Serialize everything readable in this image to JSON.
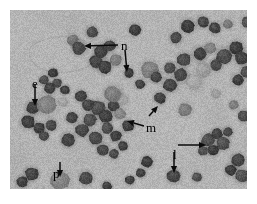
{
  "figure": {
    "kind": "light-micrograph",
    "border_color": "#ffffff",
    "background_color": "#b3b3b3",
    "cell_dark_color": "#3a3a3a",
    "cell_mid_color": "#6e6e6e",
    "cell_pale_color": "#989898"
  },
  "annotations": [
    {
      "id": "n",
      "label": "n",
      "meaning": "neutrophil",
      "label_x": 111,
      "label_y": 29,
      "arrows": [
        {
          "x1": 108,
          "y1": 35,
          "x2": 74,
          "y2": 36,
          "head": "left"
        },
        {
          "x1": 115,
          "y1": 40,
          "x2": 117,
          "y2": 62,
          "head": "down"
        }
      ]
    },
    {
      "id": "e",
      "label": "e",
      "meaning": "eosinophil",
      "label_x": 22,
      "label_y": 67,
      "arrows": [
        {
          "x1": 25,
          "y1": 74,
          "x2": 25,
          "y2": 96,
          "head": "down"
        }
      ]
    },
    {
      "id": "m",
      "label": "m",
      "meaning": "macrophage",
      "label_x": 136,
      "label_y": 111,
      "arrows": [
        {
          "x1": 134,
          "y1": 116,
          "x2": 117,
          "y2": 111,
          "head": "left-down"
        },
        {
          "x1": 139,
          "y1": 106,
          "x2": 148,
          "y2": 96,
          "head": "up-right"
        }
      ]
    },
    {
      "id": "l",
      "label": "l",
      "meaning": "lymphocyte",
      "label_x": 163,
      "label_y": 138,
      "arrows": [
        {
          "x1": 168,
          "y1": 135,
          "x2": 196,
          "y2": 135,
          "head": "right"
        },
        {
          "x1": 164,
          "y1": 142,
          "x2": 164,
          "y2": 163,
          "head": "down"
        }
      ]
    },
    {
      "id": "p",
      "label": "p",
      "meaning": "plasma cell",
      "label_x": 43,
      "label_y": 157,
      "arrows": [
        {
          "x1": 50,
          "y1": 152,
          "x2": 50,
          "y2": 167,
          "head": "down"
        }
      ]
    }
  ],
  "cells": [
    {
      "x": 178,
      "y": 16,
      "r": 7,
      "tone": "dark"
    },
    {
      "x": 193,
      "y": 12,
      "r": 6,
      "tone": "dark"
    },
    {
      "x": 205,
      "y": 18,
      "r": 6,
      "tone": "dark"
    },
    {
      "x": 218,
      "y": 14,
      "r": 5,
      "tone": "mid"
    },
    {
      "x": 237,
      "y": 12,
      "r": 6,
      "tone": "dark"
    },
    {
      "x": 125,
      "y": 20,
      "r": 6,
      "tone": "dark"
    },
    {
      "x": 82,
      "y": 22,
      "r": 6,
      "tone": "dark"
    },
    {
      "x": 63,
      "y": 30,
      "r": 6,
      "tone": "mid"
    },
    {
      "x": 69,
      "y": 38,
      "r": 7,
      "tone": "dark"
    },
    {
      "x": 91,
      "y": 42,
      "r": 7,
      "tone": "dark"
    },
    {
      "x": 100,
      "y": 36,
      "r": 6,
      "tone": "dark"
    },
    {
      "x": 86,
      "y": 52,
      "r": 7,
      "tone": "dark"
    },
    {
      "x": 95,
      "y": 57,
      "r": 7,
      "tone": "dark"
    },
    {
      "x": 106,
      "y": 50,
      "r": 6,
      "tone": "mid"
    },
    {
      "x": 119,
      "y": 63,
      "r": 5,
      "tone": "dark"
    },
    {
      "x": 140,
      "y": 60,
      "r": 9,
      "tone": "mid"
    },
    {
      "x": 146,
      "y": 67,
      "r": 6,
      "tone": "dark"
    },
    {
      "x": 160,
      "y": 58,
      "r": 6,
      "tone": "dark"
    },
    {
      "x": 166,
      "y": 28,
      "r": 6,
      "tone": "dark"
    },
    {
      "x": 174,
      "y": 50,
      "r": 7,
      "tone": "dark"
    },
    {
      "x": 190,
      "y": 44,
      "r": 7,
      "tone": "dark"
    },
    {
      "x": 200,
      "y": 38,
      "r": 6,
      "tone": "mid"
    },
    {
      "x": 214,
      "y": 46,
      "r": 8,
      "tone": "dark"
    },
    {
      "x": 226,
      "y": 38,
      "r": 7,
      "tone": "dark"
    },
    {
      "x": 232,
      "y": 48,
      "r": 7,
      "tone": "dark"
    },
    {
      "x": 206,
      "y": 55,
      "r": 6,
      "tone": "dark"
    },
    {
      "x": 193,
      "y": 60,
      "r": 8,
      "tone": "pale"
    },
    {
      "x": 184,
      "y": 72,
      "r": 9,
      "tone": "pale"
    },
    {
      "x": 171,
      "y": 65,
      "r": 7,
      "tone": "dark"
    },
    {
      "x": 160,
      "y": 75,
      "r": 7,
      "tone": "dark"
    },
    {
      "x": 228,
      "y": 70,
      "r": 6,
      "tone": "dark"
    },
    {
      "x": 236,
      "y": 62,
      "r": 6,
      "tone": "dark"
    },
    {
      "x": 43,
      "y": 63,
      "r": 5,
      "tone": "dark"
    },
    {
      "x": 34,
      "y": 70,
      "r": 5,
      "tone": "dark"
    },
    {
      "x": 47,
      "y": 73,
      "r": 5,
      "tone": "dark"
    },
    {
      "x": 40,
      "y": 78,
      "r": 6,
      "tone": "dark"
    },
    {
      "x": 55,
      "y": 80,
      "r": 5,
      "tone": "dark"
    },
    {
      "x": 23,
      "y": 98,
      "r": 7,
      "tone": "dark"
    },
    {
      "x": 37,
      "y": 95,
      "r": 10,
      "tone": "mid"
    },
    {
      "x": 53,
      "y": 92,
      "r": 5,
      "tone": "pale"
    },
    {
      "x": 18,
      "y": 112,
      "r": 7,
      "tone": "dark"
    },
    {
      "x": 29,
      "y": 118,
      "r": 6,
      "tone": "dark"
    },
    {
      "x": 41,
      "y": 115,
      "r": 6,
      "tone": "dark"
    },
    {
      "x": 34,
      "y": 126,
      "r": 5,
      "tone": "dark"
    },
    {
      "x": 62,
      "y": 108,
      "r": 6,
      "tone": "dark"
    },
    {
      "x": 71,
      "y": 86,
      "r": 6,
      "tone": "dark"
    },
    {
      "x": 58,
      "y": 130,
      "r": 7,
      "tone": "dark"
    },
    {
      "x": 72,
      "y": 120,
      "r": 7,
      "tone": "dark"
    },
    {
      "x": 80,
      "y": 110,
      "r": 7,
      "tone": "dark"
    },
    {
      "x": 88,
      "y": 98,
      "r": 8,
      "tone": "dark"
    },
    {
      "x": 78,
      "y": 95,
      "r": 6,
      "tone": "dark"
    },
    {
      "x": 96,
      "y": 106,
      "r": 7,
      "tone": "dark"
    },
    {
      "x": 104,
      "y": 96,
      "r": 6,
      "tone": "dark"
    },
    {
      "x": 97,
      "y": 118,
      "r": 6,
      "tone": "dark"
    },
    {
      "x": 86,
      "y": 128,
      "r": 7,
      "tone": "dark"
    },
    {
      "x": 106,
      "y": 126,
      "r": 6,
      "tone": "dark"
    },
    {
      "x": 110,
      "y": 104,
      "r": 6,
      "tone": "mid"
    },
    {
      "x": 113,
      "y": 90,
      "r": 6,
      "tone": "pale"
    },
    {
      "x": 103,
      "y": 84,
      "r": 9,
      "tone": "mid"
    },
    {
      "x": 118,
      "y": 116,
      "r": 6,
      "tone": "dark"
    },
    {
      "x": 93,
      "y": 140,
      "r": 6,
      "tone": "dark"
    },
    {
      "x": 104,
      "y": 144,
      "r": 5,
      "tone": "dark"
    },
    {
      "x": 113,
      "y": 136,
      "r": 5,
      "tone": "dark"
    },
    {
      "x": 50,
      "y": 170,
      "r": 10,
      "tone": "mid"
    },
    {
      "x": 22,
      "y": 164,
      "r": 7,
      "tone": "dark"
    },
    {
      "x": 12,
      "y": 172,
      "r": 6,
      "tone": "dark"
    },
    {
      "x": 31,
      "y": 178,
      "r": 4,
      "tone": "pale"
    },
    {
      "x": 76,
      "y": 168,
      "r": 7,
      "tone": "dark"
    },
    {
      "x": 97,
      "y": 176,
      "r": 5,
      "tone": "dark"
    },
    {
      "x": 120,
      "y": 170,
      "r": 5,
      "tone": "dark"
    },
    {
      "x": 137,
      "y": 152,
      "r": 6,
      "tone": "dark"
    },
    {
      "x": 131,
      "y": 163,
      "r": 5,
      "tone": "dark"
    },
    {
      "x": 164,
      "y": 166,
      "r": 7,
      "tone": "dark"
    },
    {
      "x": 187,
      "y": 167,
      "r": 5,
      "tone": "dark"
    },
    {
      "x": 198,
      "y": 130,
      "r": 7,
      "tone": "dark"
    },
    {
      "x": 207,
      "y": 124,
      "r": 6,
      "tone": "dark"
    },
    {
      "x": 213,
      "y": 133,
      "r": 7,
      "tone": "dark"
    },
    {
      "x": 203,
      "y": 140,
      "r": 6,
      "tone": "dark"
    },
    {
      "x": 193,
      "y": 141,
      "r": 5,
      "tone": "dark"
    },
    {
      "x": 218,
      "y": 122,
      "r": 5,
      "tone": "dark"
    },
    {
      "x": 228,
      "y": 150,
      "r": 7,
      "tone": "dark"
    },
    {
      "x": 221,
      "y": 160,
      "r": 6,
      "tone": "dark"
    },
    {
      "x": 232,
      "y": 166,
      "r": 7,
      "tone": "dark"
    },
    {
      "x": 234,
      "y": 106,
      "r": 6,
      "tone": "dark"
    },
    {
      "x": 224,
      "y": 95,
      "r": 5,
      "tone": "mid"
    },
    {
      "x": 175,
      "y": 100,
      "r": 7,
      "tone": "mid"
    },
    {
      "x": 150,
      "y": 88,
      "r": 6,
      "tone": "dark"
    },
    {
      "x": 130,
      "y": 74,
      "r": 5,
      "tone": "dark"
    },
    {
      "x": 206,
      "y": 84,
      "r": 5,
      "tone": "pale"
    }
  ]
}
